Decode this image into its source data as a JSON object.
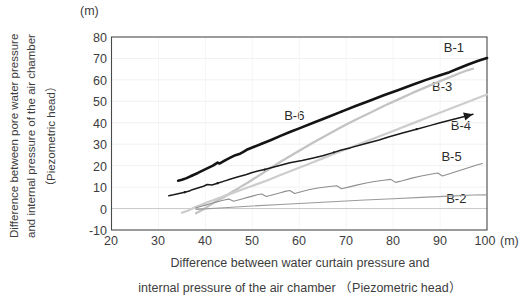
{
  "chart_data": {
    "type": "line",
    "title": "",
    "xlabel_lines": [
      "Difference between water curtain pressure and",
      "internal pressure of the air chamber （Piezometric head）"
    ],
    "ylabel_lines": [
      "Difference between pore water pressure",
      "and internal pressure of the air chamber",
      "（Piezometric head）"
    ],
    "x_unit": "(m)",
    "y_unit": "(m)",
    "xlim": [
      20,
      100
    ],
    "ylim": [
      -10,
      80
    ],
    "xticks": [
      20,
      30,
      40,
      50,
      60,
      70,
      80,
      90,
      100
    ],
    "yticks": [
      80,
      70,
      60,
      50,
      40,
      30,
      20,
      10,
      0,
      -10
    ],
    "grid": "faint-light-gray",
    "legend_position": "inline-right-end-labels",
    "series": [
      {
        "name": "B-1",
        "color": "#141414",
        "width": 2.6,
        "label_x": 92.5,
        "label_y": 74.5,
        "points": [
          [
            34.2,
            13.0
          ],
          [
            35.0,
            13.4
          ],
          [
            36.0,
            14.2
          ],
          [
            37.2,
            15.4
          ],
          [
            38.4,
            16.6
          ],
          [
            39.6,
            17.9
          ],
          [
            40.6,
            19.0
          ],
          [
            41.6,
            20.0
          ],
          [
            42.6,
            21.4
          ],
          [
            43.0,
            21.0
          ],
          [
            44.0,
            22.2
          ],
          [
            45.2,
            23.6
          ],
          [
            46.4,
            24.9
          ],
          [
            47.4,
            25.6
          ],
          [
            48.0,
            26.3
          ],
          [
            48.8,
            27.4
          ],
          [
            50.0,
            28.5
          ],
          [
            52.0,
            30.2
          ],
          [
            54.0,
            32.0
          ],
          [
            56.0,
            33.9
          ],
          [
            58.0,
            35.7
          ],
          [
            60.0,
            37.4
          ],
          [
            63.0,
            40.0
          ],
          [
            66.0,
            42.6
          ],
          [
            69.0,
            45.2
          ],
          [
            72.0,
            47.8
          ],
          [
            75.0,
            50.3
          ],
          [
            78.0,
            52.8
          ],
          [
            81.0,
            55.2
          ],
          [
            84.0,
            57.6
          ],
          [
            87.0,
            60.0
          ],
          [
            90.0,
            62.2
          ],
          [
            92.0,
            63.6
          ],
          [
            94.0,
            65.4
          ],
          [
            96.0,
            67.2
          ],
          [
            98.0,
            68.8
          ],
          [
            100.0,
            70.2
          ]
        ]
      },
      {
        "name": "B-3",
        "color": "#c3c3c3",
        "width": 2.3,
        "label_x": 90.0,
        "label_y": 56.0,
        "points": [
          [
            38.0,
            -2.2
          ],
          [
            39.0,
            -1.0
          ],
          [
            40.0,
            0.2
          ],
          [
            41.0,
            1.6
          ],
          [
            42.0,
            3.0
          ],
          [
            43.0,
            4.2
          ],
          [
            44.0,
            5.4
          ],
          [
            45.0,
            6.8
          ],
          [
            46.0,
            8.2
          ],
          [
            47.0,
            9.4
          ],
          [
            48.0,
            10.8
          ],
          [
            49.0,
            12.0
          ],
          [
            50.0,
            13.4
          ],
          [
            52.0,
            16.2
          ],
          [
            54.0,
            19.0
          ],
          [
            56.0,
            21.8
          ],
          [
            58.0,
            24.4
          ],
          [
            60.0,
            27.0
          ],
          [
            63.0,
            30.8
          ],
          [
            66.0,
            34.4
          ],
          [
            69.0,
            38.0
          ],
          [
            72.0,
            41.4
          ],
          [
            75.0,
            44.6
          ],
          [
            78.0,
            47.8
          ],
          [
            81.0,
            50.8
          ],
          [
            84.0,
            53.8
          ],
          [
            87.0,
            56.6
          ],
          [
            90.0,
            59.4
          ],
          [
            92.0,
            61.2
          ],
          [
            94.0,
            63.0
          ],
          [
            96.0,
            64.6
          ],
          [
            97.0,
            65.2
          ]
        ]
      },
      {
        "name": "B-6",
        "color": "#cdcdcd",
        "width": 2.2,
        "label_x": 58.5,
        "label_y": 42.5,
        "points": [
          [
            35.0,
            -2.0
          ],
          [
            36.0,
            -1.2
          ],
          [
            37.0,
            -0.2
          ],
          [
            38.0,
            0.8
          ],
          [
            39.0,
            1.6
          ],
          [
            40.0,
            2.6
          ],
          [
            41.5,
            3.8
          ],
          [
            43.0,
            5.0
          ],
          [
            45.0,
            6.6
          ],
          [
            47.0,
            8.2
          ],
          [
            49.0,
            9.8
          ],
          [
            51.0,
            11.4
          ],
          [
            53.0,
            13.0
          ],
          [
            56.0,
            15.6
          ],
          [
            59.0,
            18.2
          ],
          [
            62.0,
            20.8
          ],
          [
            65.0,
            23.4
          ],
          [
            68.0,
            26.0
          ],
          [
            72.0,
            29.4
          ],
          [
            76.0,
            32.8
          ],
          [
            80.0,
            36.2
          ],
          [
            84.0,
            39.6
          ],
          [
            88.0,
            43.0
          ],
          [
            92.0,
            46.4
          ],
          [
            96.0,
            49.8
          ],
          [
            99.0,
            52.4
          ],
          [
            100.0,
            53.2
          ]
        ]
      },
      {
        "name": "B-4",
        "color": "#1a1a1a",
        "width": 1.5,
        "arrow_end": true,
        "label_x": 94.0,
        "label_y": 38.0,
        "points": [
          [
            32.2,
            6.0
          ],
          [
            33.2,
            6.4
          ],
          [
            34.4,
            7.0
          ],
          [
            35.6,
            7.6
          ],
          [
            36.6,
            8.2
          ],
          [
            37.2,
            8.8
          ],
          [
            38.4,
            9.6
          ],
          [
            39.6,
            10.4
          ],
          [
            40.4,
            11.2
          ],
          [
            41.4,
            11.0
          ],
          [
            42.6,
            11.8
          ],
          [
            44.0,
            12.8
          ],
          [
            45.4,
            13.8
          ],
          [
            47.0,
            14.8
          ],
          [
            48.6,
            15.8
          ],
          [
            50.0,
            16.8
          ],
          [
            51.4,
            17.6
          ],
          [
            52.6,
            18.2
          ],
          [
            54.0,
            19.0
          ],
          [
            56.0,
            20.2
          ],
          [
            58.0,
            21.4
          ],
          [
            60.6,
            22.4
          ],
          [
            63.0,
            23.6
          ],
          [
            65.0,
            24.6
          ],
          [
            67.4,
            26.2
          ],
          [
            68.8,
            27.2
          ],
          [
            71.0,
            28.4
          ],
          [
            74.0,
            30.2
          ],
          [
            77.0,
            32.0
          ],
          [
            79.0,
            33.4
          ],
          [
            82.0,
            35.2
          ],
          [
            85.0,
            37.0
          ],
          [
            88.0,
            38.8
          ],
          [
            90.0,
            40.0
          ],
          [
            92.5,
            41.4
          ],
          [
            95.0,
            42.8
          ],
          [
            97.0,
            44.0
          ]
        ]
      },
      {
        "name": "B-5",
        "color": "#8e8e8e",
        "width": 1.1,
        "label_x": 92.0,
        "label_y": 23.5,
        "points": [
          [
            38.0,
            0.4
          ],
          [
            39.0,
            1.0
          ],
          [
            40.0,
            1.6
          ],
          [
            41.0,
            2.2
          ],
          [
            42.0,
            2.8
          ],
          [
            43.0,
            3.4
          ],
          [
            44.0,
            4.0
          ],
          [
            45.0,
            4.4
          ],
          [
            46.0,
            3.4
          ],
          [
            47.0,
            4.0
          ],
          [
            48.0,
            4.6
          ],
          [
            49.0,
            5.2
          ],
          [
            50.0,
            5.8
          ],
          [
            51.0,
            6.4
          ],
          [
            52.0,
            6.8
          ],
          [
            53.0,
            5.6
          ],
          [
            54.0,
            6.2
          ],
          [
            55.0,
            6.8
          ],
          [
            56.0,
            7.4
          ],
          [
            57.0,
            8.0
          ],
          [
            58.0,
            8.4
          ],
          [
            59.0,
            7.0
          ],
          [
            60.0,
            7.6
          ],
          [
            61.0,
            8.2
          ],
          [
            62.0,
            8.8
          ],
          [
            64.0,
            9.6
          ],
          [
            66.0,
            10.2
          ],
          [
            68.0,
            10.6
          ],
          [
            69.0,
            9.2
          ],
          [
            70.5,
            10.0
          ],
          [
            72.0,
            10.8
          ],
          [
            74.0,
            11.8
          ],
          [
            76.0,
            12.6
          ],
          [
            78.0,
            13.2
          ],
          [
            79.5,
            13.6
          ],
          [
            80.5,
            12.2
          ],
          [
            82.0,
            13.0
          ],
          [
            84.0,
            14.2
          ],
          [
            86.0,
            15.2
          ],
          [
            88.0,
            16.0
          ],
          [
            89.5,
            16.6
          ],
          [
            90.5,
            15.2
          ],
          [
            92.0,
            16.2
          ],
          [
            94.0,
            17.6
          ],
          [
            96.0,
            19.0
          ],
          [
            98.0,
            20.4
          ],
          [
            99.0,
            21.0
          ]
        ]
      },
      {
        "name": "B-2",
        "color": "#9a9a9a",
        "width": 1.1,
        "label_x": 93.0,
        "label_y": 4.0,
        "points": [
          [
            38.0,
            -0.4
          ],
          [
            44.0,
            0.4
          ],
          [
            50.0,
            1.2
          ],
          [
            56.0,
            1.9
          ],
          [
            62.0,
            2.6
          ],
          [
            68.0,
            3.3
          ],
          [
            74.0,
            4.0
          ],
          [
            80.0,
            4.6
          ],
          [
            86.0,
            5.2
          ],
          [
            92.0,
            5.8
          ],
          [
            97.0,
            6.3
          ],
          [
            100.0,
            6.4
          ]
        ]
      }
    ]
  }
}
